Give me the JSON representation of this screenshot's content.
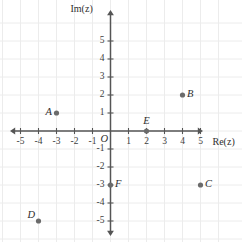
{
  "figure": {
    "title": "",
    "background_color": "#ffffff",
    "grid_color": "#ececec",
    "axis_color": "#555555",
    "point_color": "#6b6b6b",
    "text_color": "#2e2e2e"
  },
  "axes": {
    "x_axis_label": "Re(z)",
    "y_axis_label": "Im(z)",
    "origin_label": "O",
    "x_ticks": [
      "-5",
      "-4",
      "-3",
      "-2",
      "-1",
      "1",
      "2",
      "3",
      "4",
      "5"
    ],
    "y_ticks": [
      "5",
      "4",
      "3",
      "2",
      "1",
      "-1",
      "-2",
      "-3",
      "-4",
      "-5"
    ],
    "xlim": [
      -5.6,
      5.6
    ],
    "ylim": [
      -5.6,
      5.6
    ],
    "grid": true,
    "x_arrows": "both",
    "y_arrows": "both"
  },
  "chart_data": {
    "type": "scatter",
    "title": "",
    "xlabel": "Re(z)",
    "ylabel": "Im(z)",
    "xlim": [
      -5.6,
      5.6
    ],
    "ylim": [
      -5.6,
      5.6
    ],
    "grid": true,
    "legend": "none",
    "series": [
      {
        "name": "points",
        "points": [
          {
            "label": "A",
            "x": -3,
            "y": 1,
            "label_pos": "left"
          },
          {
            "label": "B",
            "x": 4,
            "y": 2,
            "label_pos": "right"
          },
          {
            "label": "C",
            "x": 5,
            "y": -3,
            "label_pos": "right"
          },
          {
            "label": "D",
            "x": -4,
            "y": -5,
            "label_pos": "upper-left"
          },
          {
            "label": "E",
            "x": 2,
            "y": 0,
            "label_pos": "above"
          },
          {
            "label": "F",
            "x": 0,
            "y": -3,
            "label_pos": "right"
          }
        ]
      }
    ]
  }
}
